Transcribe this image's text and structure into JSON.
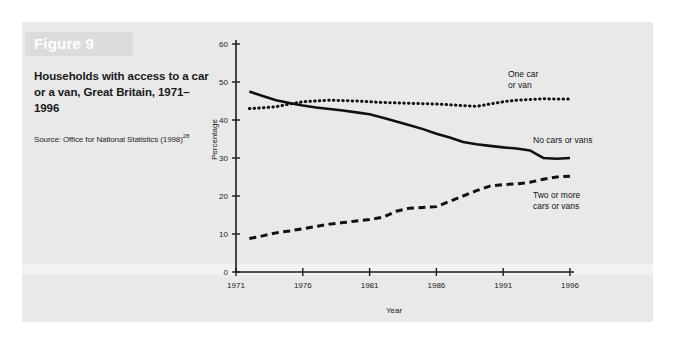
{
  "figure": {
    "banner_label": "Figure 9",
    "title": "Households with access to a car or a van, Great Britain, 1971–1996",
    "source_text": "Source: Office for National Statistics (1998)",
    "source_superscript": "28"
  },
  "chart_data": {
    "type": "line",
    "title": "Households with access to a car or a van, Great Britain, 1971–1996",
    "xlabel": "Year",
    "ylabel": "Percentage",
    "xlim": [
      1971,
      1996
    ],
    "ylim": [
      0,
      60
    ],
    "xticks": [
      "1971",
      "1976",
      "1981",
      "1986",
      "1991",
      "1996"
    ],
    "yticks": [
      "0",
      "10",
      "20",
      "30",
      "40",
      "50",
      "60"
    ],
    "grid": false,
    "legend_position": "inline-right",
    "x": [
      1972,
      1973,
      1974,
      1975,
      1976,
      1977,
      1978,
      1979,
      1980,
      1981,
      1982,
      1983,
      1984,
      1985,
      1986,
      1987,
      1988,
      1989,
      1990,
      1991,
      1992,
      1993,
      1994,
      1995,
      1996
    ],
    "series": [
      {
        "name": "No cars or vans",
        "style": "solid",
        "color": "#111111",
        "values": [
          47.5,
          46.3,
          45.2,
          44.5,
          43.8,
          43.3,
          42.9,
          42.5,
          42.0,
          41.5,
          40.6,
          39.6,
          38.6,
          37.6,
          36.4,
          35.4,
          34.2,
          33.6,
          33.2,
          32.8,
          32.5,
          32.0,
          30.0,
          29.8,
          30.0
        ]
      },
      {
        "name": "One car or van",
        "style": "dotted",
        "color": "#111111",
        "values": [
          43.0,
          43.2,
          43.5,
          44.2,
          44.8,
          45.0,
          45.2,
          45.1,
          45.0,
          44.8,
          44.6,
          44.5,
          44.4,
          44.3,
          44.2,
          44.0,
          43.8,
          43.6,
          44.2,
          44.8,
          45.2,
          45.4,
          45.6,
          45.5,
          45.5
        ]
      },
      {
        "name": "Two or more cars or vans",
        "style": "dashed",
        "color": "#111111",
        "values": [
          8.8,
          9.5,
          10.3,
          10.8,
          11.4,
          12.0,
          12.6,
          13.0,
          13.4,
          13.8,
          14.4,
          16.0,
          16.8,
          17.0,
          17.2,
          18.6,
          20.0,
          21.4,
          22.6,
          23.0,
          23.2,
          23.6,
          24.4,
          25.0,
          25.2
        ]
      }
    ],
    "annotations": [
      {
        "text": "One car\nor van",
        "series": "One car or van"
      },
      {
        "text": "No cars or vans",
        "series": "No cars or vans"
      },
      {
        "text": "Two or more\ncars or vans",
        "series": "Two or more cars or vans"
      }
    ]
  }
}
